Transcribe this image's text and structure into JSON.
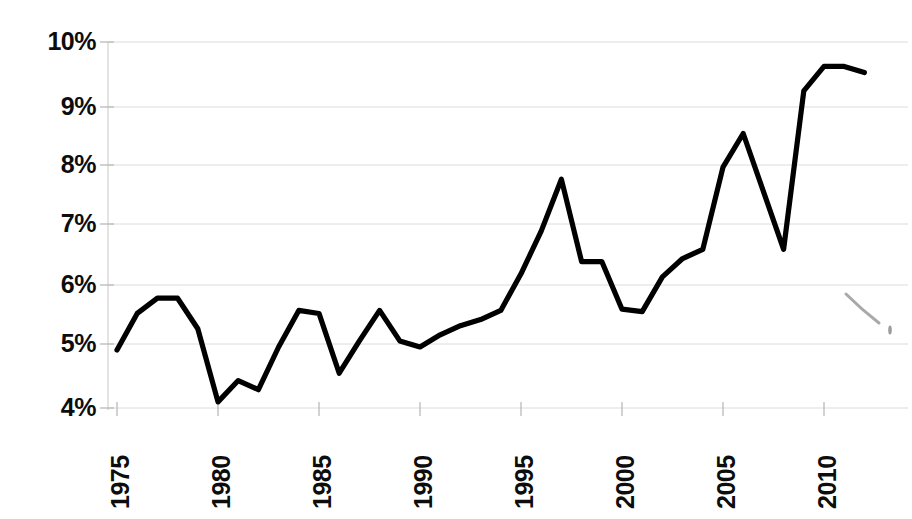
{
  "chart_data": {
    "type": "line",
    "title": "",
    "subtitle": "",
    "xlabel": "",
    "ylabel": "",
    "x": [
      1975,
      1976,
      1977,
      1978,
      1979,
      1980,
      1981,
      1982,
      1983,
      1984,
      1985,
      1986,
      1987,
      1988,
      1989,
      1990,
      1991,
      1992,
      1993,
      1994,
      1995,
      1996,
      1997,
      1998,
      1999,
      2000,
      2001,
      2002,
      2003,
      2004,
      2005,
      2006,
      2008,
      2009,
      2010,
      2011,
      2012
    ],
    "values": [
      4.95,
      5.55,
      5.8,
      5.8,
      5.3,
      4.1,
      4.45,
      4.3,
      5.0,
      5.6,
      5.55,
      4.57,
      5.1,
      5.6,
      5.1,
      5.0,
      5.2,
      5.35,
      5.45,
      5.6,
      6.2,
      6.9,
      7.75,
      6.4,
      6.4,
      5.62,
      5.58,
      6.15,
      6.45,
      6.6,
      7.95,
      8.5,
      6.6,
      9.2,
      9.6,
      9.6,
      9.5
    ],
    "series": [
      {
        "name": "",
        "values": [
          4.95,
          5.55,
          5.8,
          5.8,
          5.3,
          4.1,
          4.45,
          4.3,
          5.0,
          5.6,
          5.55,
          4.57,
          5.1,
          5.6,
          5.1,
          5.0,
          5.2,
          5.35,
          5.45,
          5.6,
          6.2,
          6.9,
          7.75,
          6.4,
          6.4,
          5.62,
          5.58,
          6.15,
          6.45,
          6.6,
          7.95,
          8.5,
          6.6,
          9.2,
          9.6,
          9.6,
          9.5
        ]
      }
    ],
    "y_tick_labels": [
      "10%",
      "9%",
      "8%",
      "7%",
      "6%",
      "5%",
      "4%"
    ],
    "y_tick_values": [
      10,
      9,
      8,
      7,
      6,
      5,
      4
    ],
    "x_tick_labels": [
      "1975",
      "1980",
      "1985",
      "1990",
      "1995",
      "2000",
      "2005",
      "2010"
    ],
    "x_tick_values": [
      1975,
      1980,
      1985,
      1990,
      1995,
      2000,
      2005,
      2010
    ],
    "xlim": [
      1974,
      1912.5
    ],
    "ylim": [
      3.7,
      10.15
    ],
    "grid": true,
    "grid_axis": "y",
    "legend": false,
    "legend_position": "none",
    "line_color": "#000000",
    "grid_color": "#dcdcdc",
    "background_color": "#ffffff",
    "annotations": []
  }
}
